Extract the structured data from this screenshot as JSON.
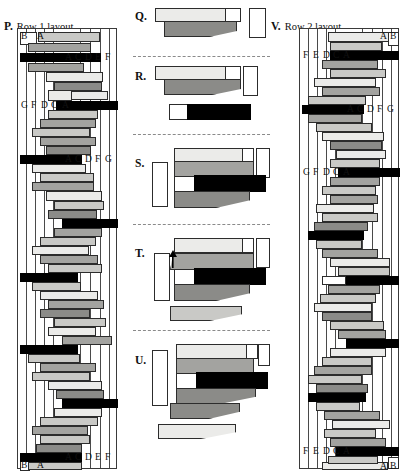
{
  "figure": {
    "title_panels": [
      {
        "id": "P",
        "label": "P.",
        "title": "Row 1 layout"
      },
      {
        "id": "Q",
        "label": "Q.",
        "title": ""
      },
      {
        "id": "R",
        "label": "R.",
        "title": ""
      },
      {
        "id": "S",
        "label": "S.",
        "title": ""
      },
      {
        "id": "T",
        "label": "T.",
        "title": ""
      },
      {
        "id": "U",
        "label": "U.",
        "title": ""
      },
      {
        "id": "V",
        "label": "V.",
        "title": "Row 2 layout"
      }
    ],
    "colors": {
      "white": "#ffffff",
      "light": "#ebebe9",
      "mid": "#c9c9c6",
      "dark": "#a3a3a0",
      "dark2": "#8b8b88",
      "black": "#000000",
      "outline": "#2c2c2c",
      "separator": "#8a8a8a"
    }
  },
  "panel_p": {
    "label": "P.",
    "title": "Row 1 layout",
    "top_tags_left": [
      "B",
      "A"
    ],
    "top_tags_right": [
      "A",
      "C",
      "D",
      "E",
      "F"
    ],
    "mid_tags_left": [
      "G",
      "F",
      "D",
      "C",
      "A"
    ],
    "mid_tags_right": [
      "A",
      "C",
      "D",
      "F",
      "G"
    ],
    "bottom_tags_right": [
      "A",
      "C",
      "D",
      "E",
      "F"
    ],
    "bottom_tags_left": [
      "B",
      "A"
    ]
  },
  "panel_q": {
    "label": "Q."
  },
  "panel_r": {
    "label": "R."
  },
  "panel_s": {
    "label": "S."
  },
  "panel_t": {
    "label": "T.",
    "annotation": "arrow-up"
  },
  "panel_u": {
    "label": "U."
  },
  "panel_v": {
    "label": "V.",
    "title": "Row 2 layout",
    "top_tags_right": [
      "A",
      "B"
    ],
    "top_tags_left": [
      "F",
      "E",
      "D",
      "C",
      "A"
    ],
    "mid_tags_right": [
      "A",
      "C",
      "D",
      "F",
      "G"
    ],
    "mid_tags_left": [
      "G",
      "F",
      "D",
      "C",
      "A"
    ],
    "bottom_tags_left": [
      "F",
      "E",
      "D",
      "C",
      "A"
    ],
    "bottom_tags_right": [
      "A",
      "B"
    ]
  }
}
